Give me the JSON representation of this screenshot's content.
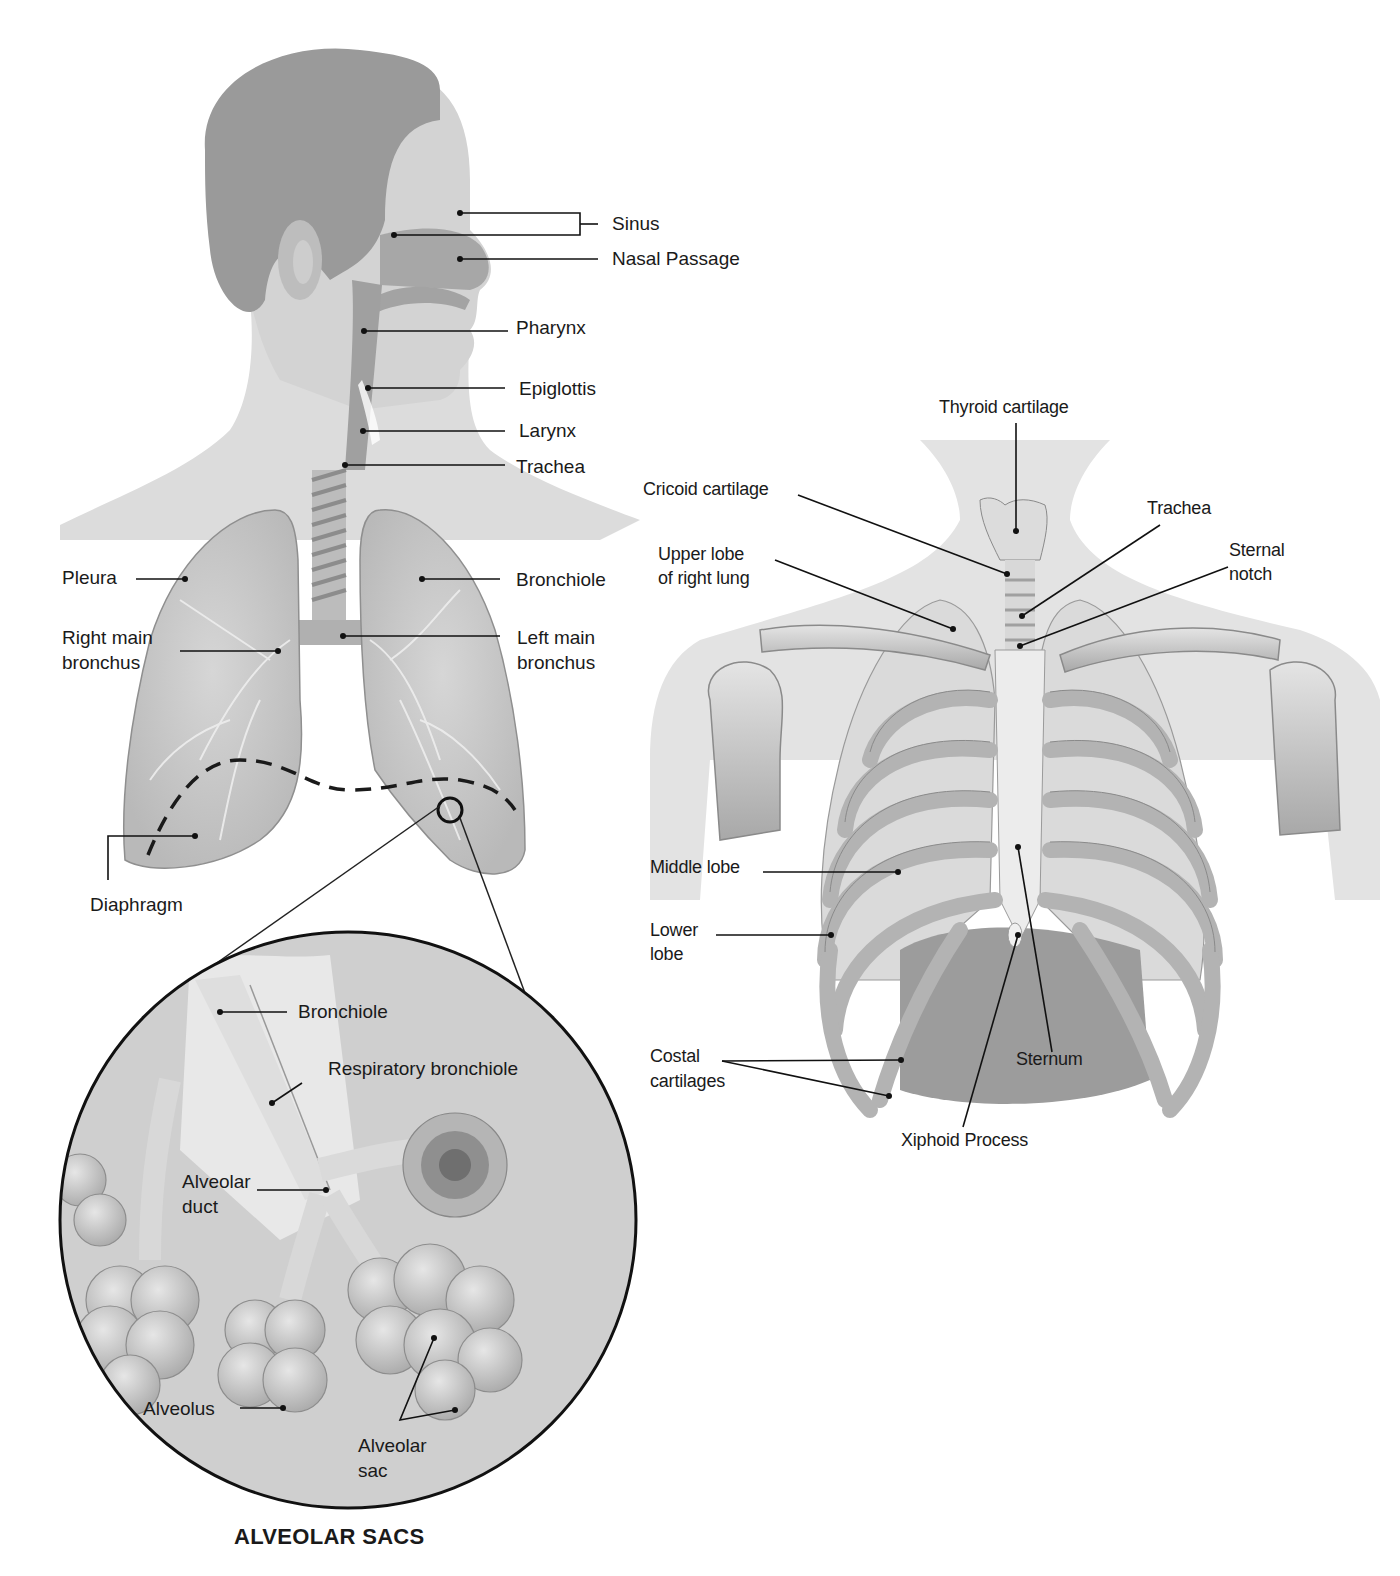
{
  "figure_left": {
    "labels": {
      "sinus": "Sinus",
      "nasal_passage": "Nasal Passage",
      "pharynx": "Pharynx",
      "epiglottis": "Epiglottis",
      "larynx": "Larynx",
      "trachea": "Trachea",
      "pleura": "Pleura",
      "bronchiole": "Bronchiole",
      "right_main_bronchus_1": "Right main",
      "right_main_bronchus_2": "bronchus",
      "left_main_bronchus_1": "Left main",
      "left_main_bronchus_2": "bronchus",
      "diaphragm": "Diaphragm"
    }
  },
  "inset": {
    "title": "ALVEOLAR SACS",
    "labels": {
      "bronchiole": "Bronchiole",
      "respiratory_bronchiole": "Respiratory bronchiole",
      "alveolar_duct_1": "Alveolar",
      "alveolar_duct_2": "duct",
      "alveolus": "Alveolus",
      "alveolar_sac_1": "Alveolar",
      "alveolar_sac_2": "sac"
    }
  },
  "figure_right": {
    "labels": {
      "thyroid_cartilage": "Thyroid cartilage",
      "cricoid_cartilage": "Cricoid cartilage",
      "trachea": "Trachea",
      "upper_lobe_1": "Upper lobe",
      "upper_lobe_2": "of right lung",
      "sternal_notch_1": "Sternal",
      "sternal_notch_2": "notch",
      "middle_lobe": "Middle lobe",
      "lower_lobe_1": "Lower",
      "lower_lobe_2": "lobe",
      "costal_1": "Costal",
      "costal_2": "cartilages",
      "sternum": "Sternum",
      "xiphoid_process": "Xiphoid Process"
    }
  }
}
